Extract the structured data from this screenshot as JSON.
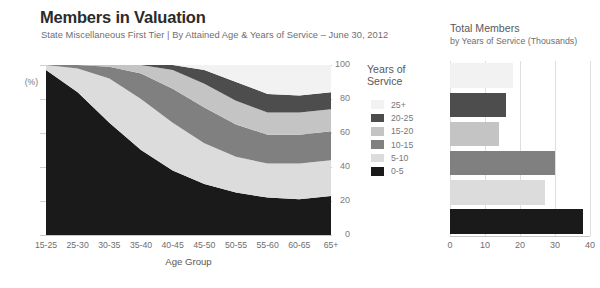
{
  "header": {
    "title": "Members in Valuation",
    "subtitle": "State Miscellaneous First Tier | By Attained Age & Years of Service – June 30, 2012"
  },
  "legend": {
    "title_line1": "Years of",
    "title_line2": "Service",
    "items": [
      {
        "label": "25+",
        "color": "#f2f2f2"
      },
      {
        "label": "20-25",
        "color": "#4d4d4d"
      },
      {
        "label": "15-20",
        "color": "#c4c4c4"
      },
      {
        "label": "10-15",
        "color": "#808080"
      },
      {
        "label": "5-10",
        "color": "#dcdcdc"
      },
      {
        "label": "0-5",
        "color": "#1a1a1a"
      }
    ]
  },
  "chart_data": [
    {
      "type": "area",
      "title": "Members in Valuation",
      "subtitle": "State Miscellaneous First Tier | By Attained Age & Years of Service – June 30, 2012",
      "xlabel": "Age Group",
      "ylabel": "(%)",
      "ylim": [
        0,
        100
      ],
      "yticks": [
        0,
        20,
        40,
        60,
        80,
        100
      ],
      "ytick_labels": [
        "0",
        "20",
        "40",
        "60",
        "80",
        "100"
      ],
      "grid": true,
      "stacked": true,
      "stack_percent": true,
      "categories": [
        "15-25",
        "25-30",
        "30-35",
        "35-40",
        "40-45",
        "45-50",
        "50-55",
        "55-60",
        "60-65",
        "65+"
      ],
      "series": [
        {
          "name": "0-5",
          "color": "#1a1a1a",
          "values": [
            97,
            84,
            66,
            50,
            38,
            30,
            25,
            22,
            21,
            23
          ]
        },
        {
          "name": "5-10",
          "color": "#dcdcdc",
          "values": [
            3,
            14,
            26,
            30,
            28,
            24,
            21,
            20,
            21,
            21
          ]
        },
        {
          "name": "10-15",
          "color": "#808080",
          "values": [
            0,
            2,
            7,
            15,
            20,
            21,
            19,
            17,
            17,
            17
          ]
        },
        {
          "name": "15-20",
          "color": "#c4c4c4",
          "values": [
            0,
            0,
            1,
            5,
            11,
            14,
            14,
            13,
            13,
            13
          ]
        },
        {
          "name": "20-25",
          "color": "#4d4d4d",
          "values": [
            0,
            0,
            0,
            0,
            3,
            8,
            11,
            11,
            10,
            10
          ]
        },
        {
          "name": "25+",
          "color": "#f2f2f2",
          "values": [
            0,
            0,
            0,
            0,
            0,
            3,
            10,
            17,
            18,
            16
          ]
        }
      ],
      "legend_position": "right",
      "legend_title": "Years of Service"
    },
    {
      "type": "bar",
      "orientation": "horizontal",
      "title": "Total Members",
      "subtitle": "by Years of Service (Thousands)",
      "categories": [
        "25+",
        "20-25",
        "15-20",
        "10-15",
        "5-10",
        "0-5"
      ],
      "values": [
        18,
        16,
        14,
        30,
        27,
        38
      ],
      "colors": [
        "#f2f2f2",
        "#4d4d4d",
        "#c4c4c4",
        "#808080",
        "#dcdcdc",
        "#1a1a1a"
      ],
      "xlim": [
        0,
        40
      ],
      "xticks": [
        0,
        10,
        20,
        30,
        40
      ],
      "xtick_labels": [
        "0",
        "10",
        "20",
        "30",
        "40"
      ],
      "grid": true
    }
  ],
  "area_axis": {
    "ytick_labels": [
      "100",
      "80",
      "60",
      "40",
      "20",
      "0"
    ],
    "pct": "(%)",
    "xtick_labels": [
      "15-25",
      "25-30",
      "30-35",
      "35-40",
      "40-45",
      "45-50",
      "50-55",
      "55-60",
      "60-65",
      "65+"
    ],
    "xlabel": "Age Group"
  },
  "bar_panel": {
    "title": "Total Members",
    "subtitle": "by Years of Service (Thousands)",
    "xtick_labels": [
      "0",
      "10",
      "20",
      "30",
      "40"
    ]
  }
}
